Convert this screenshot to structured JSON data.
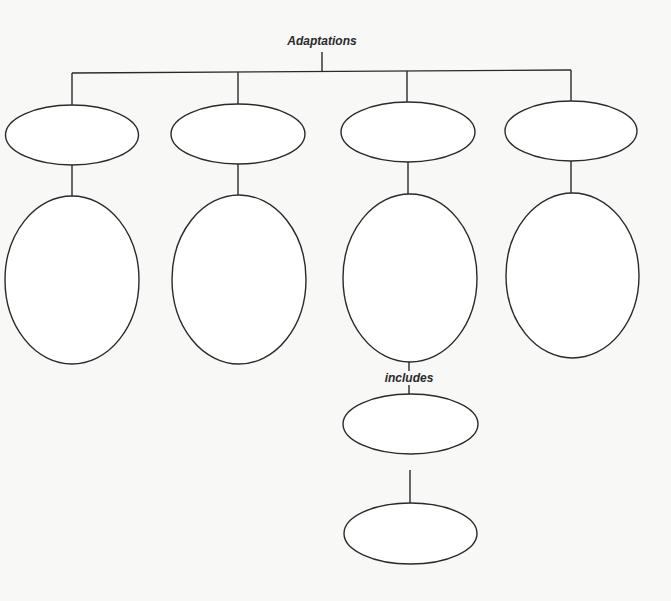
{
  "diagram": {
    "type": "concept-map",
    "root": {
      "label": "Adaptations"
    },
    "branches": [
      {
        "top_node": "",
        "bottom_node": ""
      },
      {
        "top_node": "",
        "bottom_node": ""
      },
      {
        "top_node": "",
        "bottom_node": ""
      },
      {
        "top_node": "",
        "bottom_node": ""
      }
    ],
    "sub_branch": {
      "from_branch": 3,
      "link_label": "includes",
      "nodes": [
        "",
        ""
      ]
    },
    "colors": {
      "stroke": "#2a2a2a",
      "background": "#f8f8f7",
      "node_fill": "#ffffff"
    }
  }
}
